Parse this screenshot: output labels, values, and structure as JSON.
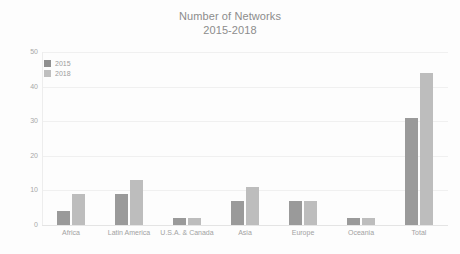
{
  "chart_data": {
    "type": "bar",
    "title": "Number of Networks",
    "subtitle": "2015-2018",
    "title_lines": [
      "Number of Networks",
      "2015-2018"
    ],
    "xlabel": "",
    "ylabel": "",
    "ylim": [
      0,
      50
    ],
    "yticks": [
      50,
      40,
      30,
      20,
      10,
      0
    ],
    "ytick_labels": [
      "50",
      "40",
      "30",
      "20",
      "10",
      "0"
    ],
    "grid": true,
    "grid_axis": "y",
    "legend_position": "top-left",
    "categories": [
      "Africa",
      "Latin America",
      "U.S.A. & Canada",
      "Asia",
      "Europe",
      "Oceania",
      "Total"
    ],
    "series": [
      {
        "name": "2015",
        "color": "#9a9a9a",
        "values": [
          4,
          9,
          2,
          7,
          7,
          2,
          31
        ]
      },
      {
        "name": "2018",
        "color": "#bdbdbd",
        "values": [
          9,
          13,
          2,
          11,
          7,
          2,
          44
        ]
      }
    ]
  },
  "legend": {
    "items": [
      {
        "label": "2015"
      },
      {
        "label": "2018"
      }
    ]
  },
  "colors": {
    "background": "#fdfdfd",
    "series_2015": "#9a9a9a",
    "series_2018": "#bdbdbd",
    "gridline": "#f0f0f0",
    "text": "#9c9c9c",
    "title": "#8c8c8c"
  }
}
